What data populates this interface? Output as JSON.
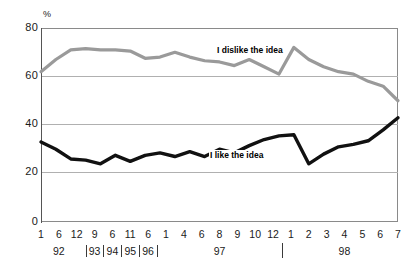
{
  "chart_data": {
    "type": "line",
    "title": "",
    "subtitle": "",
    "xlabel": "",
    "ylabel": "%",
    "ylim": [
      0,
      80
    ],
    "yticks": [
      0,
      20,
      40,
      60,
      80
    ],
    "grid": true,
    "legend_position": "inline-annotation",
    "x_month_labels": [
      "1",
      "6",
      "12",
      "9",
      "6",
      "11",
      "6",
      "1",
      "4",
      "6",
      "8",
      "9",
      "10",
      "12",
      "1",
      "2",
      "3",
      "4",
      "5",
      "6",
      "7"
    ],
    "x_year_labels": [
      "92",
      "93",
      "94",
      "95",
      "96",
      "97",
      "98"
    ],
    "x_year_spans": [
      {
        "year": "92",
        "start_index": 0,
        "end_index": 2
      },
      {
        "year": "93",
        "start_index": 3,
        "end_index": 3
      },
      {
        "year": "94",
        "start_index": 4,
        "end_index": 4
      },
      {
        "year": "95",
        "start_index": 5,
        "end_index": 5
      },
      {
        "year": "96",
        "start_index": 6,
        "end_index": 6
      },
      {
        "year": "97",
        "start_index": 7,
        "end_index": 13
      },
      {
        "year": "98",
        "start_index": 14,
        "end_index": 20
      }
    ],
    "series": [
      {
        "name": "I dislike the idea",
        "color": "#9a9a9a",
        "values": [
          62,
          67,
          71,
          71.5,
          71,
          71,
          70.5,
          67.5,
          68,
          70,
          68,
          66.5,
          66,
          64.5,
          67,
          64,
          61,
          72,
          67,
          64,
          62,
          61,
          58,
          56,
          50
        ]
      },
      {
        "name": "I like the idea",
        "color": "#111111",
        "values": [
          33,
          30,
          26,
          25.5,
          24,
          27.5,
          25,
          27.5,
          28.5,
          27,
          29,
          27,
          30,
          28.5,
          31.5,
          34,
          35.5,
          36,
          24,
          28,
          31,
          32,
          33.5,
          38,
          43
        ]
      }
    ],
    "annotations": [
      {
        "label": "I dislike the idea",
        "series": "I dislike the idea"
      },
      {
        "label": "I like the idea",
        "series": "I like the idea"
      }
    ]
  },
  "axis": {
    "unit": "%",
    "ytick_labels": [
      "80",
      "60",
      "40",
      "20",
      "0"
    ]
  }
}
